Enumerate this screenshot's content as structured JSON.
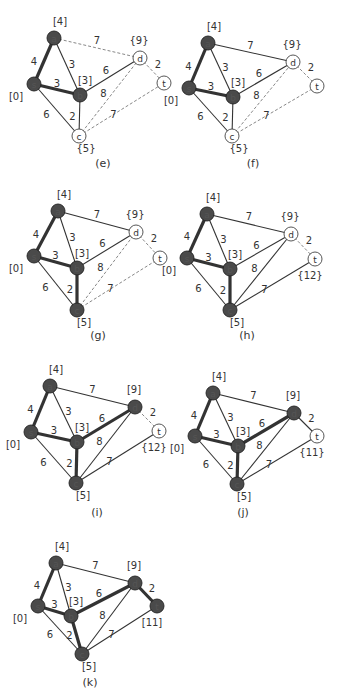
{
  "nodes": [
    "s",
    "a",
    "b",
    "c",
    "d",
    "t"
  ],
  "edges": [
    {
      "id": "s-a",
      "from": "s",
      "to": "a",
      "weight": "4"
    },
    {
      "id": "s-b",
      "from": "s",
      "to": "b",
      "weight": "3"
    },
    {
      "id": "s-c",
      "from": "s",
      "to": "c",
      "weight": "6"
    },
    {
      "id": "a-b",
      "from": "a",
      "to": "b",
      "weight": "3"
    },
    {
      "id": "a-d",
      "from": "a",
      "to": "d",
      "weight": "7"
    },
    {
      "id": "b-d",
      "from": "b",
      "to": "d",
      "weight": "6"
    },
    {
      "id": "b-c",
      "from": "b",
      "to": "c",
      "weight": "2"
    },
    {
      "id": "c-d",
      "from": "c",
      "to": "d",
      "weight": "8"
    },
    {
      "id": "c-t",
      "from": "c",
      "to": "t",
      "weight": "7"
    },
    {
      "id": "d-t",
      "from": "d",
      "to": "t",
      "weight": "2"
    }
  ],
  "panels": [
    {
      "caption": "(e)",
      "labels": {
        "s": "[0]",
        "a": "[4]",
        "b": "[3]",
        "c": "{5}",
        "d": "{9}",
        "t": ""
      },
      "visited": [
        "s",
        "a",
        "b"
      ],
      "tree_edges": [
        "s-a",
        "s-b"
      ],
      "solid_edges": [
        "a-b",
        "b-d",
        "b-c",
        "s-c"
      ],
      "dashed_edges": [
        "a-d",
        "c-d",
        "c-t",
        "d-t"
      ]
    },
    {
      "caption": "(f)",
      "labels": {
        "s": "[0]",
        "a": "[4]",
        "b": "[3]",
        "c": "{5}",
        "d": "{9}",
        "t": ""
      },
      "visited": [
        "s",
        "a",
        "b"
      ],
      "tree_edges": [
        "s-a",
        "s-b"
      ],
      "solid_edges": [
        "a-b",
        "a-d",
        "b-d",
        "b-c",
        "s-c"
      ],
      "dashed_edges": [
        "c-d",
        "c-t",
        "d-t"
      ]
    },
    {
      "caption": "(g)",
      "labels": {
        "s": "[0]",
        "a": "[4]",
        "b": "[3]",
        "c": "[5]",
        "d": "{9}",
        "t": ""
      },
      "visited": [
        "s",
        "a",
        "b",
        "c"
      ],
      "tree_edges": [
        "s-a",
        "s-b",
        "b-c"
      ],
      "solid_edges": [
        "a-b",
        "a-d",
        "b-d",
        "s-c"
      ],
      "dashed_edges": [
        "c-d",
        "c-t",
        "d-t"
      ]
    },
    {
      "caption": "(h)",
      "labels": {
        "s": "[0]",
        "a": "[4]",
        "b": "[3]",
        "c": "[5]",
        "d": "{9}",
        "t": "{12}"
      },
      "visited": [
        "s",
        "a",
        "b",
        "c"
      ],
      "tree_edges": [
        "s-a",
        "s-b",
        "b-c"
      ],
      "solid_edges": [
        "a-b",
        "a-d",
        "b-d",
        "s-c",
        "c-d",
        "c-t"
      ],
      "dashed_edges": [
        "d-t"
      ]
    },
    {
      "caption": "(i)",
      "labels": {
        "s": "[0]",
        "a": "[4]",
        "b": "[3]",
        "c": "[5]",
        "d": "[9]",
        "t": "{12}"
      },
      "visited": [
        "s",
        "a",
        "b",
        "c",
        "d"
      ],
      "tree_edges": [
        "s-a",
        "s-b",
        "b-c",
        "b-d"
      ],
      "solid_edges": [
        "a-b",
        "a-d",
        "s-c",
        "c-d",
        "c-t"
      ],
      "dashed_edges": [
        "d-t"
      ]
    },
    {
      "caption": "(j)",
      "labels": {
        "s": "[0]",
        "a": "[4]",
        "b": "[3]",
        "c": "[5]",
        "d": "[9]",
        "t": "{11}"
      },
      "visited": [
        "s",
        "a",
        "b",
        "c",
        "d"
      ],
      "tree_edges": [
        "s-a",
        "s-b",
        "b-c",
        "b-d"
      ],
      "solid_edges": [
        "a-b",
        "a-d",
        "s-c",
        "c-d",
        "c-t",
        "d-t"
      ],
      "dashed_edges": []
    },
    {
      "caption": "(k)",
      "labels": {
        "s": "[0]",
        "a": "[4]",
        "b": "[3]",
        "c": "[5]",
        "d": "[9]",
        "t": "[11]"
      },
      "visited": [
        "s",
        "a",
        "b",
        "c",
        "d",
        "t"
      ],
      "tree_edges": [
        "s-a",
        "s-b",
        "b-c",
        "b-d",
        "d-t"
      ],
      "solid_edges": [
        "a-b",
        "a-d",
        "s-c",
        "c-d",
        "c-t"
      ],
      "dashed_edges": []
    }
  ],
  "colors": {
    "visited_fill": "#4a4a4a",
    "unvisited_fill": "#ffffff",
    "edge": "#333333",
    "dashed_edge": "#888888",
    "text": "#333333"
  }
}
